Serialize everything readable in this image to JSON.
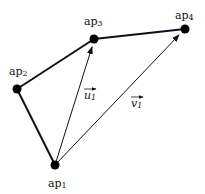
{
  "diagram": {
    "points": [
      {
        "id": "ap1",
        "base": "ap",
        "sub": "1",
        "x": 55,
        "y": 165,
        "label_x": 48,
        "label_y": 187
      },
      {
        "id": "ap2",
        "base": "ap",
        "sub": "2",
        "x": 17,
        "y": 89,
        "label_x": 9,
        "label_y": 75
      },
      {
        "id": "ap3",
        "base": "ap",
        "sub": "3",
        "x": 94,
        "y": 39,
        "label_x": 84,
        "label_y": 25
      },
      {
        "id": "ap4",
        "base": "ap",
        "sub": "4",
        "x": 185,
        "y": 29,
        "label_x": 175,
        "label_y": 19
      }
    ],
    "edges": [
      {
        "from": "ap1",
        "to": "ap2"
      },
      {
        "from": "ap2",
        "to": "ap3"
      },
      {
        "from": "ap3",
        "to": "ap4"
      }
    ],
    "vectors": [
      {
        "id": "u1",
        "base": "u",
        "sub": "1",
        "from": "ap1",
        "to": "ap3",
        "label_x": 83,
        "label_y": 99
      },
      {
        "id": "v1",
        "base": "v",
        "sub": "1",
        "from": "ap1",
        "to": "ap4",
        "label_x": 131,
        "label_y": 107
      }
    ],
    "colors": {
      "line": "#111111",
      "point": "#000000",
      "background": "#ffffff"
    }
  }
}
